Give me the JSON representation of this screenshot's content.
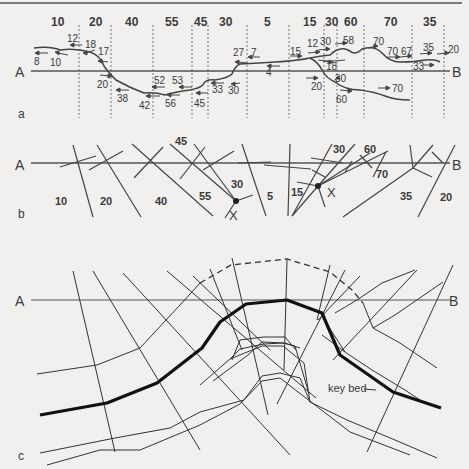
{
  "figure": {
    "panel_a": {
      "label": "a",
      "line_start": "A",
      "line_end": "B",
      "domain_dips": [
        "10",
        "20",
        "40",
        "55",
        "45",
        "30",
        "5",
        "15",
        "30",
        "60",
        "70",
        "35"
      ],
      "measurements": [
        "8",
        "10",
        "12",
        "18",
        "17",
        "20",
        "38",
        "42",
        "52",
        "53",
        "56",
        "45",
        "33",
        "30",
        "27",
        "7",
        "4",
        "15",
        "12",
        "30",
        "58",
        "18",
        "30",
        "20",
        "60",
        "70",
        "70",
        "67",
        "35",
        "20",
        "33",
        "70"
      ]
    },
    "panel_b": {
      "label": "b",
      "line_start": "A",
      "line_end": "B",
      "dips": [
        "45",
        "10",
        "20",
        "40",
        "55",
        "30",
        "5",
        "15",
        "30",
        "60",
        "70",
        "35",
        "20"
      ],
      "intersection_label": "X"
    },
    "panel_c": {
      "label": "c",
      "line_start": "A",
      "line_end": "B",
      "key_bed_label": "key bed"
    }
  }
}
